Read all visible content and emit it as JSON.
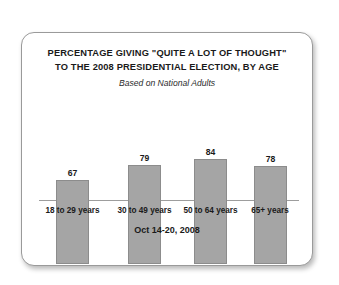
{
  "chart_data": {
    "type": "bar",
    "title": "PERCENTAGE GIVING \"QUITE A LOT OF THOUGHT\" TO THE 2008 PRESIDENTIAL ELECTION, BY AGE",
    "title_lines": [
      "PERCENTAGE GIVING \"QUITE A LOT OF THOUGHT\"",
      "TO THE 2008 PRESIDENTIAL ELECTION, BY AGE"
    ],
    "subtitle": "Based on National Adults",
    "categories": [
      "18 to 29 years",
      "30 to 49 years",
      "50 to 64 years",
      "65+ years"
    ],
    "values": [
      67,
      79,
      84,
      78
    ],
    "xlabel": "",
    "ylabel": "",
    "ylim": [
      0,
      100
    ],
    "grid": false,
    "legend": "none",
    "footnote": "Oct 14-20, 2008",
    "bar_color": "#a5a5a5",
    "bar_border_color": "#8c8c8c",
    "axis_color": "#9d9d9d",
    "text_color": "#1a1a1a"
  }
}
